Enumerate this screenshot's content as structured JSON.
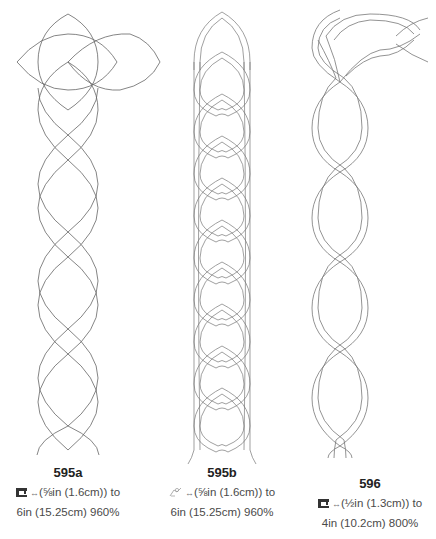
{
  "designs": [
    {
      "id": "595a",
      "title": "595a",
      "icon": "sewing-machine-icon",
      "line1_suffix": "(⅝in (1.6cm)) to",
      "line2": "6in (15.25cm) 960%"
    },
    {
      "id": "595b",
      "title": "595b",
      "icon": "hand-quilting-icon",
      "line1_suffix": "(⅝in (1.6cm)) to",
      "line2": "6in (15.25cm) 960%"
    },
    {
      "id": "596",
      "title": "596",
      "icon": "sewing-machine-icon",
      "line1_suffix": "(½in (1.3cm)) to",
      "line2": "4in (10.2cm) 800%"
    }
  ],
  "arrow_glyph": "↔",
  "colors": {
    "line": "#555555",
    "text": "#4a4a4a",
    "heading": "#222222"
  }
}
